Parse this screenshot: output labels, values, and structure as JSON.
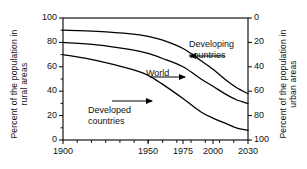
{
  "chart_data": {
    "type": "line",
    "title": "",
    "xlabel": "",
    "ylabel": "Percent of the population in rural areas",
    "ylabel_right": "Percent of the population in urban areas",
    "xlim": [
      1900,
      2030
    ],
    "ylim": [
      0,
      100
    ],
    "ylim_right": [
      100,
      0
    ],
    "grid": false,
    "legend": "inline annotations with arrows",
    "xticks": [
      "1900",
      "1950",
      "1975",
      "2000",
      "2030"
    ],
    "xtick_values": [
      1900,
      1950,
      1975,
      2000,
      2030
    ],
    "yticks_left": [
      "0",
      "20",
      "40",
      "60",
      "80",
      "100"
    ],
    "ytick_values_left": [
      0,
      20,
      40,
      60,
      80,
      100
    ],
    "yticks_right": [
      "0",
      "20",
      "40",
      "60",
      "80",
      "100"
    ],
    "ytick_values_right": [
      0,
      20,
      40,
      60,
      80,
      100
    ],
    "series": [
      {
        "name": "Developing countries",
        "x": [
          1900,
          1920,
          1940,
          1950,
          1960,
          1975,
          1990,
          2000,
          2010,
          2020,
          2030
        ],
        "values": [
          90,
          89,
          87,
          85,
          82,
          75,
          65,
          58,
          50,
          43,
          38
        ]
      },
      {
        "name": "World",
        "x": [
          1900,
          1920,
          1940,
          1950,
          1960,
          1975,
          1990,
          2000,
          2010,
          2020,
          2030
        ],
        "values": [
          80,
          78,
          74,
          71,
          67,
          60,
          50,
          44,
          38,
          33,
          30
        ]
      },
      {
        "name": "Developed countries",
        "x": [
          1900,
          1920,
          1940,
          1950,
          1960,
          1975,
          1990,
          2000,
          2010,
          2020,
          2030
        ],
        "values": [
          70,
          65,
          58,
          53,
          46,
          34,
          23,
          18,
          14,
          10,
          8
        ]
      }
    ],
    "annotations": [
      {
        "label_line1": "Developing",
        "label_line2": "countries",
        "arrow": "left"
      },
      {
        "label_line1": "World",
        "label_line2": "",
        "arrow": "right"
      },
      {
        "label_line1": "Developed",
        "label_line2": "countries",
        "arrow": "right"
      }
    ]
  },
  "axes": {
    "left_title_line1": "Percent of the population in",
    "left_title_line2": "rural areas",
    "right_title_line1": "Percent of the population in",
    "right_title_line2": "urban areas"
  },
  "labels": {
    "developing_1": "Developing",
    "developing_2": "countries",
    "world": "World",
    "developed_1": "Developed",
    "developed_2": "countries"
  },
  "colors": {
    "line": "#000000",
    "frame": "#000000",
    "background": "#ffffff"
  }
}
